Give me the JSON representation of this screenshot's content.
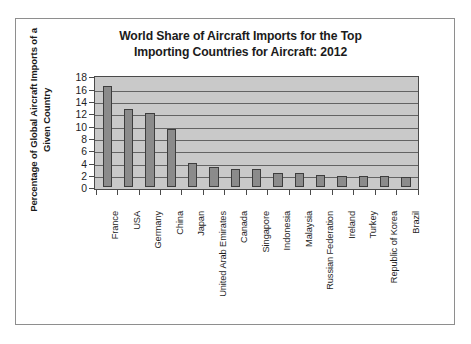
{
  "chart_data": {
    "type": "bar",
    "title": "World Share of Aircraft Imports for the Top Importing Countries for Aircraft: 2012",
    "title_lines": [
      "World Share of Aircraft Imports for the Top",
      "Importing Countries for Aircraft: 2012"
    ],
    "xlabel": "",
    "ylabel": "Percentage of Global Aircraft Imports of a Given Country",
    "ylabel_lines": [
      "Percentage of Global Aircraft Imports of a",
      "Given Country"
    ],
    "ylim": [
      0,
      18
    ],
    "yticks": [
      18,
      16,
      14,
      12,
      10,
      8,
      6,
      4,
      2,
      0
    ],
    "ytick_step": 2,
    "grid": true,
    "grid_axis": "y",
    "legend": false,
    "legend_position": "none",
    "bar_fill_color": "#8b8b8b",
    "bar_edge_color": "#3d3d3d",
    "plot_background_color": "#c9c9c9",
    "gridline_color": "#636363",
    "categories": [
      "France",
      "USA",
      "Germany",
      "China",
      "Japan",
      "United Arab Emirates",
      "Canada",
      "Singapore",
      "Indonesia",
      "Malaysia",
      "Russian Federation",
      "Ireland",
      "Turkey",
      "Republic of Korea",
      "Brazil"
    ],
    "values": [
      16.5,
      12.7,
      12.0,
      9.4,
      3.9,
      3.3,
      3.0,
      3.0,
      2.4,
      2.4,
      2.0,
      1.9,
      1.9,
      1.9,
      1.7
    ]
  }
}
